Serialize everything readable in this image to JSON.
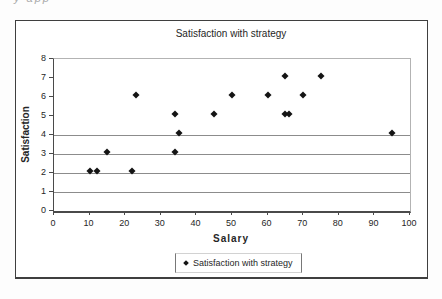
{
  "page": {
    "cropped_text_fragment": "y app"
  },
  "chart_data": {
    "type": "scatter",
    "title": "Satisfaction with strategy",
    "xlabel": "Salary",
    "ylabel": "Satisfaction",
    "xlim": [
      0,
      100
    ],
    "ylim": [
      0,
      8
    ],
    "x_ticks": [
      0,
      10,
      20,
      30,
      40,
      50,
      60,
      70,
      80,
      90,
      100
    ],
    "y_ticks": [
      0,
      1,
      2,
      3,
      4,
      5,
      6,
      7,
      8
    ],
    "visible_gridlines_y": [
      1,
      2,
      3,
      4
    ],
    "grid": "horizontal-partial",
    "marker_color": "#141414",
    "legend": {
      "position": "bottom",
      "entries": [
        {
          "label": "Satisfaction with strategy",
          "marker": "diamond",
          "color": "#141414"
        }
      ]
    },
    "series": [
      {
        "name": "Satisfaction with strategy",
        "marker": "diamond",
        "color": "#141414",
        "points": [
          {
            "x": 10,
            "y": 2
          },
          {
            "x": 12,
            "y": 2
          },
          {
            "x": 15,
            "y": 3
          },
          {
            "x": 22,
            "y": 2
          },
          {
            "x": 23,
            "y": 6
          },
          {
            "x": 34,
            "y": 3
          },
          {
            "x": 34,
            "y": 5
          },
          {
            "x": 35,
            "y": 4
          },
          {
            "x": 45,
            "y": 5
          },
          {
            "x": 50,
            "y": 6
          },
          {
            "x": 60,
            "y": 6
          },
          {
            "x": 65,
            "y": 5
          },
          {
            "x": 65,
            "y": 7
          },
          {
            "x": 66,
            "y": 5
          },
          {
            "x": 70,
            "y": 6
          },
          {
            "x": 75,
            "y": 7
          },
          {
            "x": 95,
            "y": 4
          }
        ]
      }
    ]
  }
}
